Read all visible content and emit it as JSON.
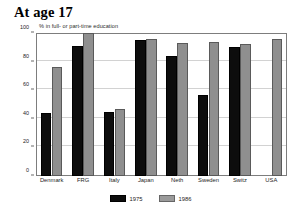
{
  "figure": {
    "title": "At age 17",
    "subtitle": "% in full- or part-time education"
  },
  "chart_data": {
    "type": "bar",
    "title": "At age 17",
    "subtitle": "% in full- or part-time education",
    "xlabel": "",
    "ylabel": "% in full- or part-time education",
    "ylim": [
      0,
      100
    ],
    "yticks": [
      0,
      20,
      40,
      60,
      80,
      100
    ],
    "ytick_labels": [
      "0",
      "20",
      "40",
      "60",
      "80",
      "100"
    ],
    "grid": true,
    "legend_position": "bottom-center",
    "categories": [
      "Denmark",
      "FRG",
      "Italy",
      "Japan",
      "Neth",
      "Sweden",
      "Switz",
      "USA"
    ],
    "series": [
      {
        "name": "1975",
        "color": "#0d0d0d",
        "values": [
          44,
          91,
          45,
          95,
          84,
          57,
          90,
          null
        ]
      },
      {
        "name": "1986",
        "color": "#8f8f8f",
        "values": [
          76,
          100,
          47,
          96,
          93,
          94,
          92,
          96
        ]
      }
    ]
  }
}
